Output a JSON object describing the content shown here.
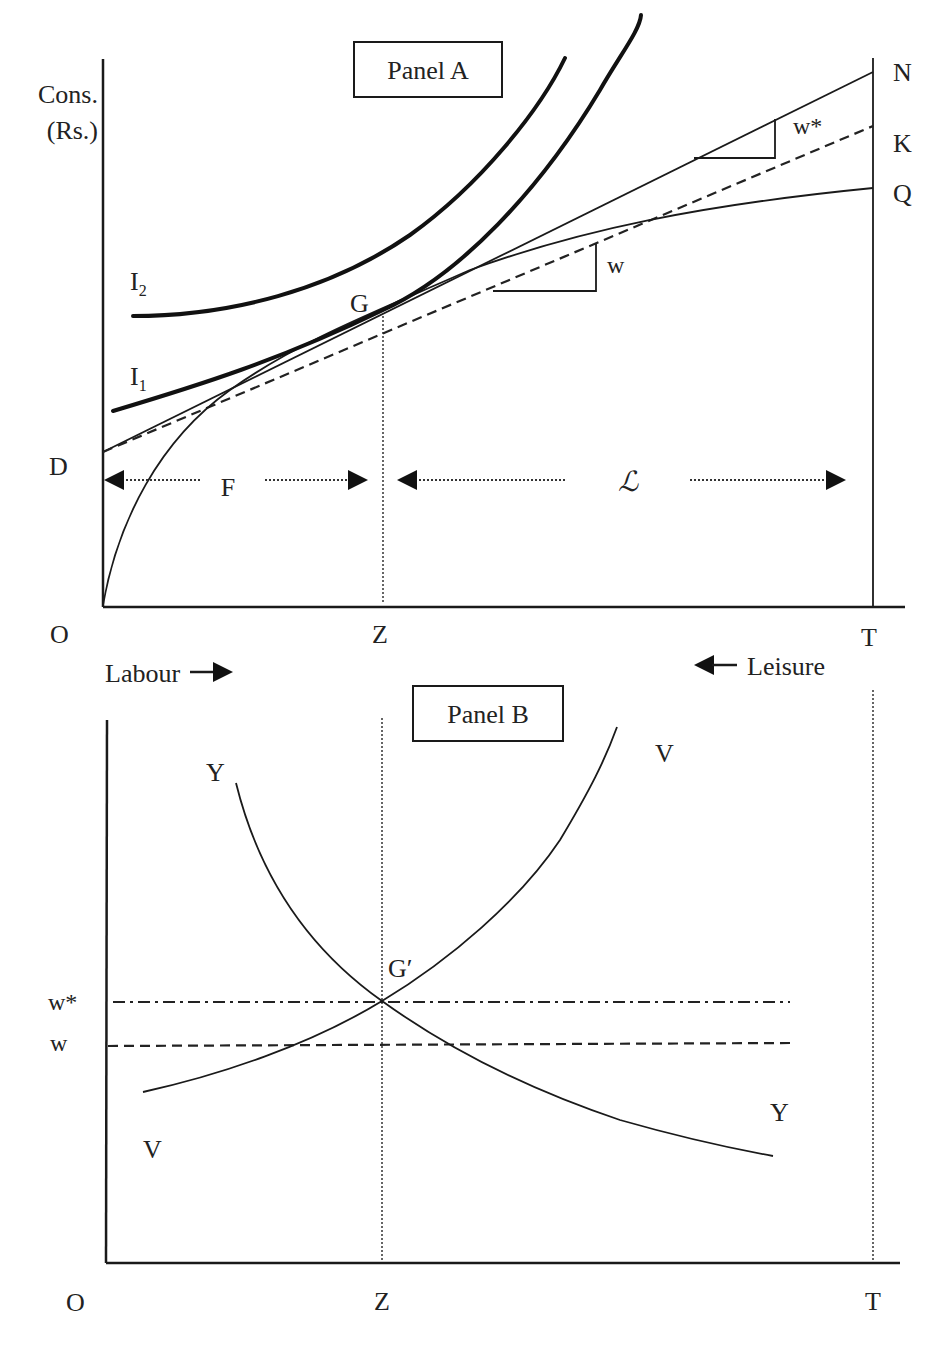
{
  "panel_a": {
    "title": "Panel A",
    "y_axis_label_line1": "Cons.",
    "y_axis_label_line2": "(Rs.)",
    "origin_label": "O",
    "z_label": "Z",
    "t_label": "T",
    "d_label": "D",
    "g_label": "G",
    "n_label": "N",
    "k_label": "K",
    "q_label": "Q",
    "i1_label": "I",
    "i1_sub": "1",
    "i2_label": "I",
    "i2_sub": "2",
    "f_label": "F",
    "l_label": "ℒ",
    "w_label": "w",
    "wstar_label": "w*",
    "labour_label": "Labour",
    "leisure_label": "Leisure"
  },
  "panel_b": {
    "title": "Panel B",
    "origin_label": "O",
    "z_label": "Z",
    "t_label": "T",
    "gprime_label": "G′",
    "wstar_label": "w*",
    "w_label": "w",
    "y_top_label": "Y",
    "y_bottom_label": "Y",
    "v_top_label": "V",
    "v_bottom_label": "V"
  },
  "colors": {
    "ink": "#1a1a1a",
    "background": "#ffffff"
  }
}
